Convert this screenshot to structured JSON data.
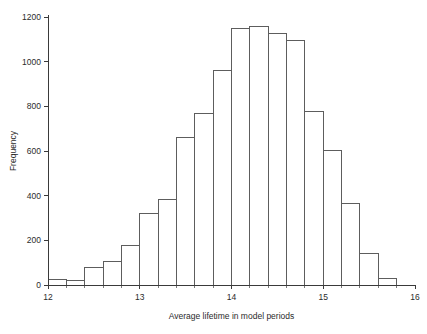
{
  "chart_data": {
    "type": "bar",
    "title": "",
    "subtitle": "",
    "xlabel": "Average lifetime in model periods",
    "ylabel": "Frequency",
    "xlim": [
      12,
      16
    ],
    "ylim": [
      0,
      1200
    ],
    "grid": false,
    "legend": null,
    "bin_width": 0.2,
    "xticks": [
      12,
      13,
      14,
      15,
      16
    ],
    "xtick_labels": [
      "12",
      "13",
      "14",
      "15",
      "16"
    ],
    "yticks": [
      0,
      200,
      400,
      600,
      800,
      1000,
      1200
    ],
    "ytick_labels": [
      "0",
      "200",
      "400",
      "600",
      "800",
      "1000",
      "1200"
    ],
    "x_minor_ticks": [
      12.2,
      12.4,
      12.6,
      12.8,
      13.2,
      13.4,
      13.6,
      13.8,
      14.2,
      14.4,
      14.6,
      14.8,
      15.2,
      15.4,
      15.6,
      15.8
    ],
    "bin_edges": [
      12.0,
      12.2,
      12.4,
      12.6,
      12.8,
      13.0,
      13.2,
      13.4,
      13.6,
      13.8,
      14.0,
      14.2,
      14.4,
      14.6,
      14.8,
      15.0,
      15.2,
      15.4,
      15.6,
      15.8
    ],
    "categories": [
      "12.0-12.2",
      "12.2-12.4",
      "12.4-12.6",
      "12.6-12.8",
      "12.8-13.0",
      "13.0-13.2",
      "13.2-13.4",
      "13.4-13.6",
      "13.6-13.8",
      "13.8-14.0",
      "14.0-14.2",
      "14.2-14.4",
      "14.4-14.6",
      "14.6-14.8",
      "14.8-15.0",
      "15.0-15.2",
      "15.2-15.4",
      "15.4-15.6",
      "15.6-15.8"
    ],
    "values": [
      25,
      20,
      80,
      103,
      175,
      318,
      385,
      660,
      770,
      960,
      1150,
      1158,
      1125,
      1095,
      778,
      603,
      363,
      140,
      30
    ],
    "colors": {
      "bar_fill": "#ffffff",
      "bar_stroke": "#5d5d5d",
      "axis": "#3a3a3a",
      "text": "#2b2b2b",
      "background": "#ffffff"
    }
  }
}
